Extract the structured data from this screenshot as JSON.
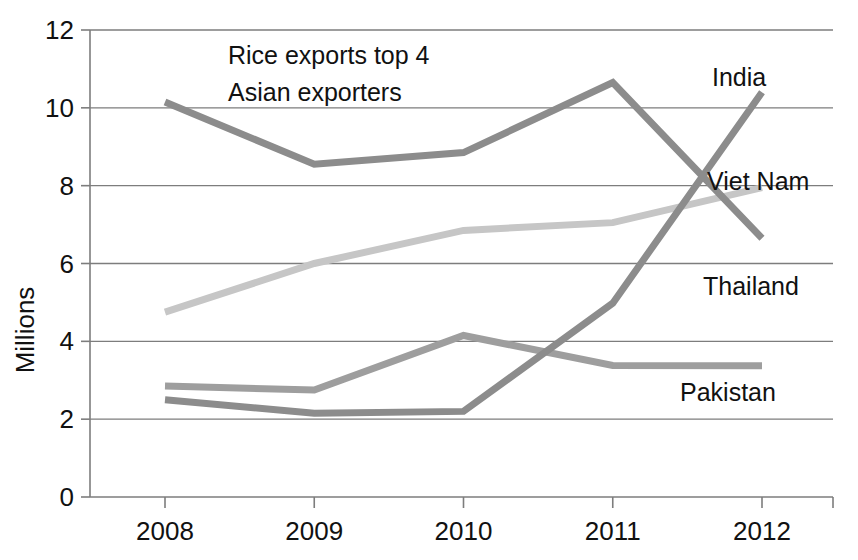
{
  "chart_data": {
    "type": "line",
    "title": "",
    "annotation": [
      "Rice exports top 4",
      "Asian exporters"
    ],
    "xlabel": "",
    "ylabel": "Millions",
    "categories": [
      "2008",
      "2009",
      "2010",
      "2011",
      "2012"
    ],
    "x": [
      2008,
      2009,
      2010,
      2011,
      2012
    ],
    "ylim": [
      0,
      12
    ],
    "yticks": [
      "0",
      "2",
      "4",
      "6",
      "8",
      "10",
      "12"
    ],
    "ytick_values": [
      0,
      2,
      4,
      6,
      8,
      10,
      12
    ],
    "grid": "horizontal",
    "legend_position": "inline-right-labels",
    "series": [
      {
        "name": "Thailand",
        "values": [
          10.15,
          8.55,
          8.85,
          10.65,
          6.65
        ],
        "color": "#8c8c8c",
        "label": "Thailand"
      },
      {
        "name": "Viet Nam",
        "values": [
          4.75,
          6.0,
          6.85,
          7.05,
          7.95
        ],
        "color": "#c6c6c6",
        "label": "Viet Nam"
      },
      {
        "name": "Pakistan",
        "values": [
          2.85,
          2.75,
          4.15,
          3.38,
          3.37
        ],
        "color": "#9e9e9e",
        "label": "Pakistan"
      },
      {
        "name": "India",
        "values": [
          2.5,
          2.15,
          2.2,
          4.98,
          10.4
        ],
        "color": "#8c8c8c",
        "label": "India"
      }
    ],
    "series_labels": [
      {
        "text": "India",
        "x": 712,
        "y": 86
      },
      {
        "text": "Viet Nam",
        "x": 707,
        "y": 190
      },
      {
        "text": "Thailand",
        "x": 703,
        "y": 295
      },
      {
        "text": "Pakistan",
        "x": 680,
        "y": 401
      }
    ]
  },
  "axis": {
    "ylabel": "Millions",
    "ytick_labels": [
      "12",
      "10",
      "8",
      "6",
      "4",
      "2",
      "0"
    ],
    "xtick_labels": [
      "2008",
      "2009",
      "2010",
      "2011",
      "2012"
    ]
  },
  "annotation": {
    "line1": "Rice exports top 4",
    "line2": "Asian exporters"
  },
  "colors": {
    "grid": "#7d7d7d",
    "text": "#111111",
    "background": "#ffffff",
    "thailand": "#8c8c8c",
    "vietnam": "#c6c6c6",
    "pakistan": "#9e9e9e",
    "india": "#8c8c8c"
  }
}
